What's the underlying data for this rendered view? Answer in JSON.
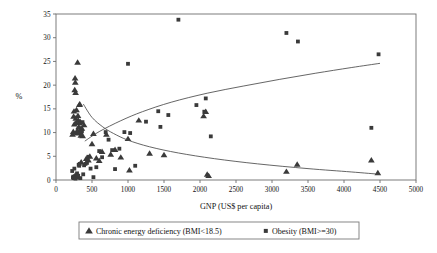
{
  "chart_data": {
    "type": "scatter",
    "title": "",
    "xlabel": "GNP (US$ per capita)",
    "ylabel": "%",
    "xlim": [
      0,
      5000
    ],
    "ylim": [
      0,
      35
    ],
    "xticks": [
      0,
      500,
      1000,
      1500,
      2000,
      2500,
      3000,
      3500,
      4000,
      4500,
      5000
    ],
    "yticks": [
      0,
      5,
      10,
      15,
      20,
      25,
      30,
      35
    ],
    "grid": false,
    "legend_position": "below-plot",
    "marker_color": "#3a3a3a",
    "trendline_color": "#4a4a4a",
    "frame_color": "#6e6e6e",
    "series": [
      {
        "name": "Chronic energy deficiency (BMI<18.5)",
        "marker": "triangle",
        "points": [
          [
            230,
            9.6
          ],
          [
            240,
            10.2
          ],
          [
            245,
            13.4
          ],
          [
            250,
            14.5
          ],
          [
            255,
            11.8
          ],
          [
            260,
            19.0
          ],
          [
            265,
            21.5
          ],
          [
            268,
            20.6
          ],
          [
            272,
            18.4
          ],
          [
            275,
            13.0
          ],
          [
            280,
            12.1
          ],
          [
            285,
            14.8
          ],
          [
            288,
            9.9
          ],
          [
            295,
            10.4
          ],
          [
            300,
            24.8
          ],
          [
            305,
            13.6
          ],
          [
            310,
            12.6
          ],
          [
            315,
            11.2
          ],
          [
            320,
            10.0
          ],
          [
            325,
            15.9
          ],
          [
            330,
            16.0
          ],
          [
            335,
            12.3
          ],
          [
            340,
            10.8
          ],
          [
            345,
            9.4
          ],
          [
            350,
            3.8
          ],
          [
            360,
            10.9
          ],
          [
            370,
            9.3
          ],
          [
            390,
            11.6
          ],
          [
            420,
            4.5
          ],
          [
            450,
            4.2
          ],
          [
            470,
            5.0
          ],
          [
            500,
            7.6
          ],
          [
            520,
            9.8
          ],
          [
            560,
            4.6
          ],
          [
            600,
            4.1
          ],
          [
            640,
            6.0
          ],
          [
            700,
            9.6
          ],
          [
            760,
            5.4
          ],
          [
            820,
            6.4
          ],
          [
            900,
            4.8
          ],
          [
            1000,
            8.7
          ],
          [
            1020,
            2.1
          ],
          [
            1150,
            12.6
          ],
          [
            1300,
            5.6
          ],
          [
            1500,
            5.3
          ],
          [
            2050,
            13.5
          ],
          [
            2080,
            14.4
          ],
          [
            2100,
            1.2
          ],
          [
            2120,
            0.9
          ],
          [
            3200,
            1.8
          ],
          [
            3350,
            3.3
          ],
          [
            4380,
            4.2
          ],
          [
            4470,
            1.5
          ]
        ],
        "trendline": {
          "description": "declining curve from ~16% at GNP 380 to ~1% at GNP 4500",
          "points": [
            [
              380,
              16.0
            ],
            [
              500,
              13.2
            ],
            [
              650,
              11.2
            ],
            [
              800,
              9.8
            ],
            [
              1000,
              8.4
            ],
            [
              1300,
              7.0
            ],
            [
              1700,
              5.7
            ],
            [
              2200,
              4.5
            ],
            [
              2800,
              3.4
            ],
            [
              3500,
              2.4
            ],
            [
              4100,
              1.7
            ],
            [
              4500,
              1.2
            ]
          ]
        }
      },
      {
        "name": "Obesity (BMI>=30)",
        "marker": "square",
        "points": [
          [
            225,
            1.9
          ],
          [
            235,
            0.5
          ],
          [
            240,
            0.7
          ],
          [
            248,
            0.4
          ],
          [
            255,
            2.4
          ],
          [
            262,
            0.8
          ],
          [
            270,
            0.3
          ],
          [
            278,
            1.0
          ],
          [
            285,
            0.6
          ],
          [
            292,
            1.4
          ],
          [
            300,
            0.5
          ],
          [
            308,
            0.9
          ],
          [
            315,
            3.2
          ],
          [
            322,
            3.0
          ],
          [
            330,
            3.4
          ],
          [
            338,
            0.4
          ],
          [
            345,
            11.9
          ],
          [
            352,
            9.6
          ],
          [
            360,
            10.3
          ],
          [
            368,
            12.2
          ],
          [
            378,
            1.2
          ],
          [
            390,
            3.1
          ],
          [
            410,
            3.4
          ],
          [
            430,
            3.6
          ],
          [
            450,
            4.9
          ],
          [
            480,
            2.4
          ],
          [
            520,
            0.6
          ],
          [
            560,
            2.7
          ],
          [
            600,
            6.1
          ],
          [
            640,
            4.8
          ],
          [
            690,
            10.1
          ],
          [
            730,
            8.5
          ],
          [
            780,
            6.3
          ],
          [
            820,
            2.3
          ],
          [
            880,
            6.6
          ],
          [
            950,
            10.1
          ],
          [
            1000,
            24.5
          ],
          [
            1030,
            9.9
          ],
          [
            1100,
            3.0
          ],
          [
            1250,
            12.3
          ],
          [
            1420,
            14.5
          ],
          [
            1450,
            11.2
          ],
          [
            1560,
            13.7
          ],
          [
            1700,
            33.8
          ],
          [
            1950,
            15.8
          ],
          [
            2060,
            14.4
          ],
          [
            2080,
            17.2
          ],
          [
            2150,
            9.2
          ],
          [
            3200,
            31.0
          ],
          [
            3360,
            29.2
          ],
          [
            4380,
            11.0
          ],
          [
            4480,
            26.5
          ]
        ],
        "trendline": {
          "description": "rising curve from ~8% at GNP 400 to ~25% at GNP 4500",
          "points": [
            [
              400,
              8.2
            ],
            [
              600,
              10.2
            ],
            [
              900,
              12.5
            ],
            [
              1200,
              14.4
            ],
            [
              1600,
              16.4
            ],
            [
              2100,
              18.3
            ],
            [
              2600,
              19.8
            ],
            [
              3100,
              21.2
            ],
            [
              3600,
              22.5
            ],
            [
              4100,
              23.7
            ],
            [
              4500,
              24.6
            ]
          ]
        }
      }
    ]
  },
  "legend": {
    "entries": [
      {
        "label": "Chronic energy deficiency (BMI<18.5)",
        "marker": "triangle"
      },
      {
        "label": "Obesity (BMI>=30)",
        "marker": "square"
      }
    ]
  },
  "axes": {
    "x_title": "GNP (US$ per capita)",
    "y_title": "%",
    "x_tick_labels": [
      "0",
      "500",
      "1000",
      "1500",
      "2000",
      "2500",
      "3000",
      "3500",
      "4000",
      "4500",
      "5000"
    ],
    "y_tick_labels": [
      "0",
      "5",
      "10",
      "15",
      "20",
      "25",
      "30",
      "35"
    ]
  }
}
